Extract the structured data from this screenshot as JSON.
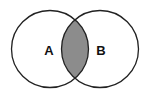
{
  "diagram": {
    "type": "venn",
    "sets": [
      {
        "label": "A",
        "cx": 50,
        "cy": 49,
        "r": 38.5
      },
      {
        "label": "B",
        "cx": 100,
        "cy": 49,
        "r": 38.5
      }
    ],
    "highlight": "intersection",
    "colors": {
      "stroke": "#222222",
      "fill": "#ffffff",
      "highlight": "#8c8c8c"
    }
  }
}
